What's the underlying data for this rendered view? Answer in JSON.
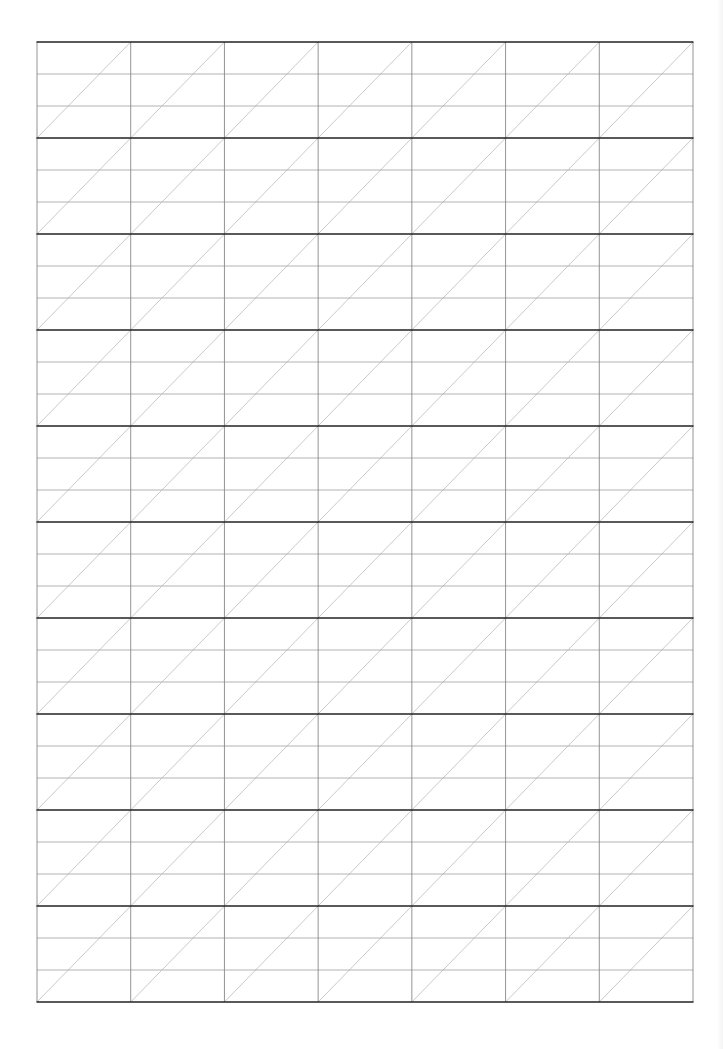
{
  "sheet": {
    "type": "calligraphy-practice-grid",
    "rows": 10,
    "columns": 7,
    "bands_per_row": 3,
    "diagonal": "bottom-left-to-top-right",
    "bounds": {
      "left": 37,
      "top": 42,
      "right": 693,
      "bottom": 1002
    },
    "colors": {
      "row_border": "#222222",
      "column_line": "#888888",
      "band_line": "#aaaaaa",
      "diagonal_line": "#bbbbbb",
      "background": "#ffffff"
    }
  }
}
